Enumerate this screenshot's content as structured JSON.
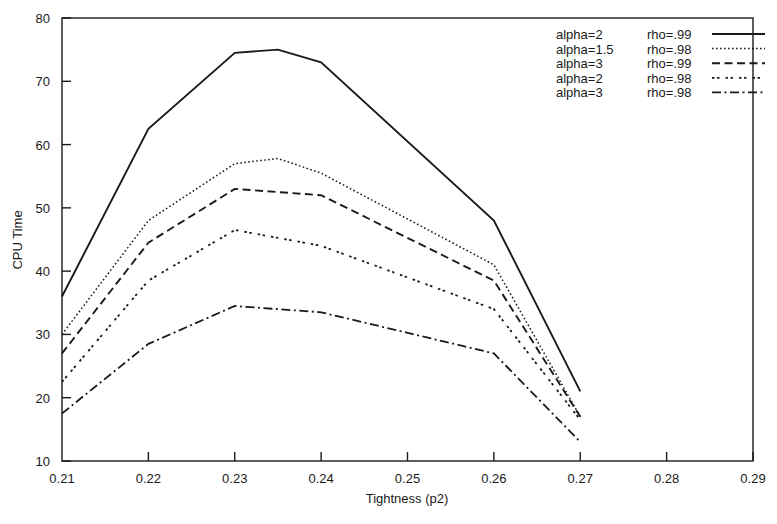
{
  "chart_data": {
    "type": "line",
    "title": "",
    "xlabel": "Tightness (p2)",
    "ylabel": "CPU Time",
    "xlim": [
      0.21,
      0.29
    ],
    "ylim": [
      10,
      80
    ],
    "xticks": [
      "0.21",
      "0.22",
      "0.23",
      "0.24",
      "0.25",
      "0.26",
      "0.27",
      "0.28",
      "0.29"
    ],
    "xtick_values": [
      0.21,
      0.22,
      0.23,
      0.24,
      0.25,
      0.26,
      0.27,
      0.28,
      0.29
    ],
    "yticks": [
      "10",
      "20",
      "30",
      "40",
      "50",
      "60",
      "70",
      "80"
    ],
    "ytick_values": [
      10,
      20,
      30,
      40,
      50,
      60,
      70,
      80
    ],
    "grid": false,
    "legend_position": "top-right",
    "series": [
      {
        "name": "alpha=2   rho=.99",
        "label_alpha": "alpha=2",
        "label_rho": "rho=.99",
        "style": "solid",
        "dash": "none",
        "width": 1.9,
        "x": [
          0.21,
          0.22,
          0.23,
          0.235,
          0.24,
          0.26,
          0.27
        ],
        "values": [
          36,
          62.5,
          74.5,
          75,
          73,
          48,
          21
        ]
      },
      {
        "name": "alpha=1.5 rho=.98",
        "label_alpha": "alpha=1.5",
        "label_rho": "rho=.98",
        "style": "dotted",
        "dash": "1.6,2.4",
        "width": 1.5,
        "x": [
          0.21,
          0.22,
          0.23,
          0.235,
          0.24,
          0.26,
          0.27
        ],
        "values": [
          30,
          48,
          57,
          57.8,
          55.5,
          41,
          17
        ]
      },
      {
        "name": "alpha=3   rho=.99",
        "label_alpha": "alpha=3",
        "label_rho": "rho=.99",
        "style": "dashed",
        "dash": "8,4.5",
        "width": 1.9,
        "x": [
          0.21,
          0.22,
          0.23,
          0.24,
          0.26,
          0.27
        ],
        "values": [
          27,
          44.5,
          53,
          52,
          38.5,
          17
        ]
      },
      {
        "name": "alpha=2   rho=.98",
        "label_alpha": "alpha=2",
        "label_rho": "rho=.98",
        "style": "fine-dotted",
        "dash": "2.5,2.5,2.5,6",
        "width": 1.8,
        "x": [
          0.21,
          0.22,
          0.23,
          0.24,
          0.26,
          0.27
        ],
        "values": [
          22.5,
          38.5,
          46.5,
          44,
          34,
          16.5
        ]
      },
      {
        "name": "alpha=3   rho=.98",
        "label_alpha": "alpha=3",
        "label_rho": "rho=.98",
        "style": "dash-dot",
        "dash": "9,3.5,2,3.5",
        "width": 1.8,
        "x": [
          0.21,
          0.22,
          0.23,
          0.24,
          0.26,
          0.27
        ],
        "values": [
          17.5,
          28.5,
          34.5,
          33.5,
          27,
          13
        ]
      }
    ]
  }
}
